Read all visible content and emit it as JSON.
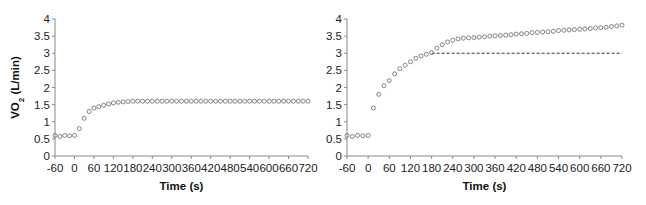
{
  "chart_data": [
    {
      "type": "scatter",
      "panel": "left",
      "title": "",
      "xlabel": "Time (s)",
      "ylabel": "VO2 (L/min)",
      "xlim": [
        -60,
        720
      ],
      "ylim": [
        0,
        4
      ],
      "x_ticks": [
        -60,
        0,
        60,
        120,
        180,
        240,
        300,
        360,
        420,
        480,
        540,
        600,
        660,
        720
      ],
      "y_ticks": [
        0,
        0.5,
        1,
        1.5,
        2,
        2.5,
        3,
        3.5,
        4
      ],
      "y_tick_labels": [
        "0",
        "0.5",
        "1",
        "1.5",
        "2",
        "2.5",
        "3",
        "3.5",
        "4"
      ],
      "grid": false,
      "marker": "open-circle",
      "series": [
        {
          "name": "VO2",
          "x": [
            -60,
            -45,
            -30,
            -15,
            0,
            15,
            30,
            45,
            60,
            75,
            90,
            105,
            120,
            135,
            150,
            165,
            180,
            195,
            210,
            225,
            240,
            255,
            270,
            285,
            300,
            315,
            330,
            345,
            360,
            375,
            390,
            405,
            420,
            435,
            450,
            465,
            480,
            495,
            510,
            525,
            540,
            555,
            570,
            585,
            600,
            615,
            630,
            645,
            660,
            675,
            690,
            705,
            720
          ],
          "y": [
            0.6,
            0.57,
            0.6,
            0.59,
            0.6,
            0.8,
            1.1,
            1.3,
            1.4,
            1.44,
            1.48,
            1.52,
            1.55,
            1.57,
            1.58,
            1.59,
            1.6,
            1.6,
            1.6,
            1.6,
            1.6,
            1.6,
            1.6,
            1.6,
            1.6,
            1.6,
            1.6,
            1.6,
            1.6,
            1.6,
            1.6,
            1.6,
            1.6,
            1.6,
            1.6,
            1.6,
            1.6,
            1.6,
            1.6,
            1.6,
            1.6,
            1.6,
            1.6,
            1.6,
            1.6,
            1.6,
            1.6,
            1.6,
            1.6,
            1.6,
            1.6,
            1.6,
            1.6
          ]
        }
      ]
    },
    {
      "type": "scatter",
      "panel": "right",
      "title": "",
      "xlabel": "Time (s)",
      "ylabel": "",
      "xlim": [
        -60,
        720
      ],
      "ylim": [
        0,
        4
      ],
      "x_ticks": [
        -60,
        0,
        60,
        120,
        180,
        240,
        300,
        360,
        420,
        480,
        540,
        600,
        660,
        720
      ],
      "y_ticks": [
        0,
        0.5,
        1,
        1.5,
        2,
        2.5,
        3,
        3.5,
        4
      ],
      "y_tick_labels": [
        "0",
        "0.5",
        "1",
        "1.5",
        "2",
        "2.5",
        "3",
        "3.5",
        "4"
      ],
      "grid": false,
      "marker": "open-circle",
      "series": [
        {
          "name": "VO2",
          "x": [
            -60,
            -45,
            -30,
            -15,
            0,
            15,
            30,
            45,
            60,
            75,
            90,
            105,
            120,
            135,
            150,
            165,
            180,
            195,
            210,
            225,
            240,
            255,
            270,
            285,
            300,
            315,
            330,
            345,
            360,
            375,
            390,
            405,
            420,
            435,
            450,
            465,
            480,
            495,
            510,
            525,
            540,
            555,
            570,
            585,
            600,
            615,
            630,
            645,
            660,
            675,
            690,
            705,
            720
          ],
          "y": [
            0.6,
            0.57,
            0.6,
            0.59,
            0.6,
            1.4,
            1.8,
            2.05,
            2.2,
            2.4,
            2.55,
            2.65,
            2.75,
            2.85,
            2.92,
            2.97,
            3.02,
            3.15,
            3.25,
            3.33,
            3.38,
            3.42,
            3.44,
            3.45,
            3.46,
            3.47,
            3.48,
            3.5,
            3.51,
            3.52,
            3.53,
            3.54,
            3.56,
            3.57,
            3.58,
            3.6,
            3.61,
            3.62,
            3.63,
            3.64,
            3.66,
            3.67,
            3.68,
            3.69,
            3.7,
            3.71,
            3.72,
            3.74,
            3.75,
            3.76,
            3.78,
            3.8,
            3.82
          ]
        }
      ],
      "reference_line": {
        "style": "dashed",
        "y": 3.0,
        "x_start": 180,
        "x_end": 720
      }
    }
  ]
}
